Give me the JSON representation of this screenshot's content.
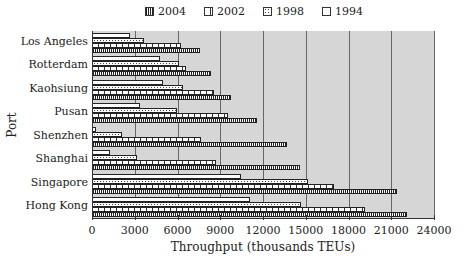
{
  "chart_data": {
    "type": "bar",
    "orientation": "horizontal",
    "title": "",
    "xlabel": "Throughput (thousands TEUs)",
    "ylabel": "Port",
    "xlim": [
      0,
      24000
    ],
    "x_ticks": [
      "0",
      "3000",
      "6000",
      "9000",
      "12000",
      "15000",
      "18000",
      "21000",
      "24000"
    ],
    "grid": true,
    "legend_position": "top",
    "legend": [
      "2004",
      "2002",
      "1998",
      "1994"
    ],
    "categories": [
      "Los Angeles",
      "Rotterdam",
      "Kaohsiung",
      "Pusan",
      "Shenzhen",
      "Shanghai",
      "Singapore",
      "Hong Kong"
    ],
    "series": [
      {
        "name": "1994",
        "values": [
          2600,
          4700,
          4900,
          3300,
          200,
          1200,
          10400,
          11000
        ]
      },
      {
        "name": "1998",
        "values": [
          3600,
          6000,
          6300,
          5900,
          2000,
          3100,
          15100,
          14600
        ]
      },
      {
        "name": "2002",
        "values": [
          6200,
          6500,
          8500,
          9500,
          7600,
          8600,
          16900,
          19100
        ]
      },
      {
        "name": "2004",
        "values": [
          7500,
          8300,
          9700,
          11500,
          13600,
          14500,
          21300,
          22000
        ]
      }
    ]
  },
  "legend_labels": [
    "2004",
    "2002",
    "1998",
    "1994"
  ],
  "axis": {
    "xlabel": "Throughput (thousands TEUs)",
    "ylabel": "Port"
  }
}
